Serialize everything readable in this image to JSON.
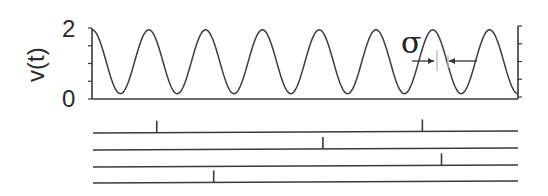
{
  "chart_data": {
    "type": "line",
    "title": "",
    "xlabel": "",
    "ylabel": "v(t)",
    "ylim": [
      0,
      2
    ],
    "yticks": [
      "0",
      "2"
    ],
    "minor_ytick_count": 4,
    "grid": false,
    "series": [
      {
        "name": "v(t)",
        "function": "periodic sinusoid",
        "max": 1.95,
        "min": 0.15,
        "periods_shown": 7.5,
        "first_peak_phase": 0
      }
    ],
    "annotation": {
      "label": "σ",
      "description": "width marker between converging arrows on the falling edge of a peak"
    },
    "spike_trains": [
      {
        "name": "train-1",
        "spike_times_fraction": [
          0.15,
          0.775
        ]
      },
      {
        "name": "train-2",
        "spike_times_fraction": [
          0.541
        ]
      },
      {
        "name": "train-3",
        "spike_times_fraction": [
          0.82
        ]
      },
      {
        "name": "train-4",
        "spike_times_fraction": [
          0.284
        ]
      }
    ]
  }
}
